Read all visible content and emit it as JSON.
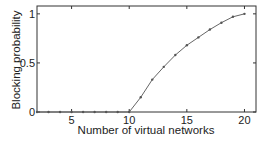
{
  "chart_data": {
    "type": "line",
    "title": "",
    "xlabel": "Number of virtual networks",
    "ylabel": "Blocking probability",
    "x": [
      2,
      3,
      4,
      5,
      6,
      7,
      8,
      9,
      10,
      11,
      12,
      13,
      14,
      15,
      16,
      17,
      18,
      19,
      20
    ],
    "series": [
      {
        "name": "Blocking probability",
        "values": [
          0,
          0,
          0,
          0,
          0,
          0,
          0,
          0,
          0,
          0.15,
          0.33,
          0.46,
          0.58,
          0.68,
          0.76,
          0.84,
          0.91,
          0.97,
          1.0
        ]
      }
    ],
    "xlim": [
      2,
      21
    ],
    "ylim": [
      0,
      1.08
    ],
    "xticks": [
      "5",
      "10",
      "15",
      "20"
    ],
    "yticks": [
      "0",
      "0.5",
      "1"
    ],
    "grid": false,
    "legend": "none"
  }
}
